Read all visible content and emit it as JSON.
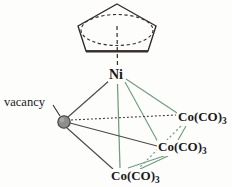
{
  "figure": {
    "kind": "chemical-structure-diagram",
    "width": 232,
    "height": 187,
    "background_color": "#fdfdfc"
  },
  "colors": {
    "bond_metal_green": "#6f9c7e",
    "bond_dark": "#4a4a4a",
    "ring_outline": "#2f2a26",
    "ring_base_edge": "#3a332d",
    "text": "#191919",
    "vacancy_fill": "#8d8d8d",
    "vacancy_stroke": "#3d3d3d"
  },
  "ligand": {
    "name": "cyclopentadienyl-ring",
    "shape": "pentagon",
    "aromatic_indicator": "dashed-ellipse",
    "bond_to_metal": "dashed-vertical-line"
  },
  "atoms": {
    "nickel": {
      "name": "Ni",
      "label": "Ni",
      "x": 118,
      "y": 76
    },
    "cobalt_right": {
      "name": "Co(CO)3",
      "label": "Co(CO)",
      "subscript": "3",
      "x": 176,
      "y": 117
    },
    "cobalt_middle": {
      "name": "Co(CO)3",
      "label": "Co(CO)",
      "subscript": "3",
      "x": 156,
      "y": 147
    },
    "cobalt_bottom": {
      "name": "Co(CO)3",
      "label": "Co(CO)",
      "subscript": "3",
      "x": 140,
      "y": 176
    }
  },
  "vacancy": {
    "label": "vacancy",
    "marker_shape": "filled-circle",
    "marker_x": 64,
    "marker_y": 122,
    "marker_radius": 6.2,
    "leader_line_from": [
      58,
      104
    ],
    "leader_line_to": [
      60,
      117
    ]
  },
  "bonds": [
    {
      "from": "cyclopentadienyl",
      "to": "Ni",
      "style": "dashed",
      "color": "#3a332d"
    },
    {
      "from": "Ni",
      "to": "cobalt_right",
      "style": "solid",
      "color": "#6f9c7e"
    },
    {
      "from": "Ni",
      "to": "cobalt_middle",
      "style": "solid",
      "color": "#6f9c7e"
    },
    {
      "from": "Ni",
      "to": "cobalt_bottom",
      "style": "solid",
      "color": "#6f9c7e"
    },
    {
      "from": "cobalt_right",
      "to": "cobalt_middle",
      "style": "solid",
      "color": "#6f9c7e"
    },
    {
      "from": "cobalt_right",
      "to": "cobalt_bottom",
      "style": "dotted",
      "color": "#6f9c7e"
    },
    {
      "from": "cobalt_middle",
      "to": "cobalt_bottom",
      "style": "solid",
      "color": "#6f9c7e"
    },
    {
      "from": "vacancy",
      "to": "Ni",
      "style": "solid",
      "color": "#4a4a4a"
    },
    {
      "from": "vacancy",
      "to": "cobalt_right",
      "style": "dotted",
      "color": "#3d3d3d"
    },
    {
      "from": "vacancy",
      "to": "cobalt_middle",
      "style": "solid",
      "color": "#4a4a4a"
    },
    {
      "from": "vacancy",
      "to": "cobalt_bottom",
      "style": "solid",
      "color": "#4a4a4a"
    }
  ]
}
